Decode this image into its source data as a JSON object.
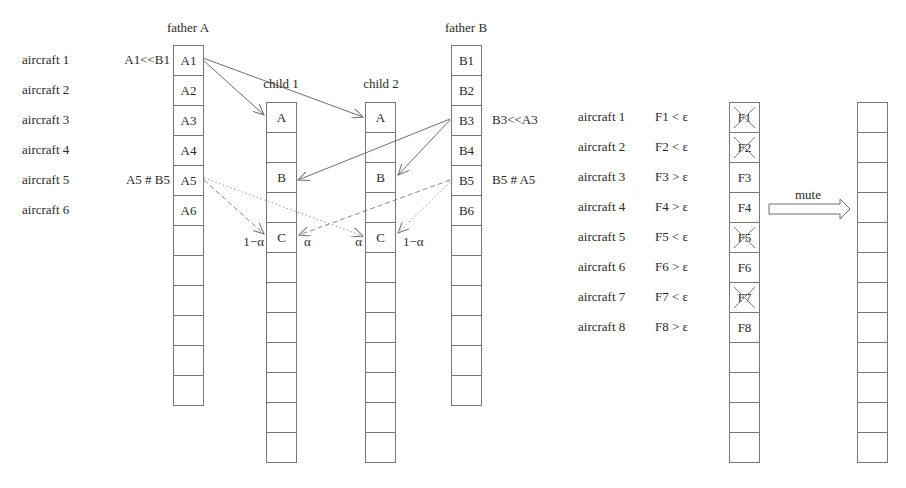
{
  "crossover": {
    "row_labels": [
      "aircraft 1",
      "aircraft 2",
      "aircraft 3",
      "aircraft 4",
      "aircraft 5",
      "aircraft 6"
    ],
    "father_a": {
      "title": "father A",
      "cells": [
        "A1",
        "A2",
        "A3",
        "A4",
        "A5",
        "A6",
        "",
        "",
        "",
        "",
        "",
        ""
      ],
      "notes": {
        "a1": "A1<<B1",
        "a5": "A5 # B5"
      }
    },
    "child_1": {
      "title": "child 1",
      "cells": [
        "A",
        "",
        "B",
        "",
        "C",
        "",
        "",
        "",
        "",
        "",
        "",
        ""
      ],
      "weight_left": "1−α",
      "weight_right": "α"
    },
    "child_2": {
      "title": "child 2",
      "cells": [
        "A",
        "",
        "B",
        "",
        "C",
        "",
        "",
        "",
        "",
        "",
        "",
        ""
      ],
      "weight_left": "α",
      "weight_right": "1−α"
    },
    "father_b": {
      "title": "father B",
      "cells": [
        "B1",
        "B2",
        "B3",
        "B4",
        "B5",
        "B6",
        "",
        "",
        "",
        "",
        "",
        ""
      ],
      "notes": {
        "b3": "B3<<A3",
        "b5": "B5 # A5"
      }
    }
  },
  "mutation": {
    "rows": [
      {
        "label": "aircraft 1",
        "condition": "F1 < ε",
        "cell": "F1",
        "crossed": true
      },
      {
        "label": "aircraft 2",
        "condition": "F2 < ε",
        "cell": "F2",
        "crossed": true
      },
      {
        "label": "aircraft 3",
        "condition": "F3 > ε",
        "cell": "F3",
        "crossed": false
      },
      {
        "label": "aircraft 4",
        "condition": "F4 > ε",
        "cell": "F4",
        "crossed": false
      },
      {
        "label": "aircraft 5",
        "condition": "F5 < ε",
        "cell": "F5",
        "crossed": true
      },
      {
        "label": "aircraft 6",
        "condition": "F6 > ε",
        "cell": "F6",
        "crossed": false
      },
      {
        "label": "aircraft 7",
        "condition": "F7 < ε",
        "cell": "F7",
        "crossed": true
      },
      {
        "label": "aircraft 8",
        "condition": "F8 > ε",
        "cell": "F8",
        "crossed": false
      }
    ],
    "empty_cells_below": 4,
    "arrow_label": "mute",
    "result_cells": 12
  },
  "colors": {
    "line": "#777777",
    "arrow": "#6e6e6e",
    "text": "#2a2a2a"
  }
}
